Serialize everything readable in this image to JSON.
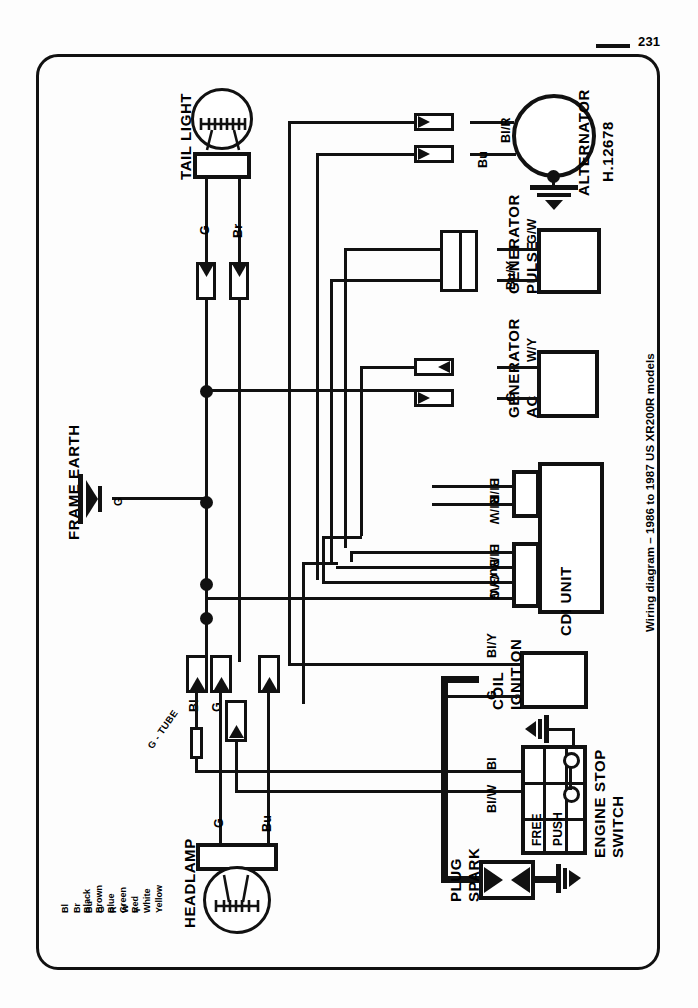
{
  "page": {
    "number": "231",
    "caption": "Wiring diagram – 1986 to 1987 US XR200R models"
  },
  "components": {
    "tail_light": {
      "label": "TAIL LIGHT",
      "wires": [
        "G",
        "Br"
      ]
    },
    "headlamp": {
      "label": "HEADLAMP",
      "wires": [
        "G",
        "Bu"
      ]
    },
    "frame_earth": {
      "label": "FRAME EARTH",
      "wire": "G"
    },
    "alternator": {
      "label": "ALTERNATOR",
      "code": "H.12678",
      "wires": [
        "Bl/R",
        "Bu"
      ]
    },
    "pulse_generator": {
      "label_line1": "PULSE",
      "label_line2": "GENERATOR",
      "wires": [
        "G/W",
        "Bu/Y"
      ]
    },
    "ac_generator": {
      "label_line1": "AC",
      "label_line2": "GENERATOR",
      "wires": [
        "W/Y",
        "G"
      ]
    },
    "cdi_unit": {
      "label": "CDI UNIT",
      "wires_upper": [
        "Bl/R",
        "Bl/W"
      ],
      "wires_lower": [
        "Bl/Y",
        "Bu/Y",
        "G/W",
        "G"
      ]
    },
    "ignition_coil": {
      "label_line1": "IGNITION",
      "label_line2": "COIL",
      "wires": [
        "Bl/Y",
        "G"
      ]
    },
    "engine_stop_switch": {
      "label_line1": "ENGINE STOP",
      "label_line2": "SWITCH",
      "positions": [
        "FREE",
        "PUSH"
      ],
      "wires": [
        "Bl/W",
        "Bl"
      ]
    },
    "spark_plug": {
      "label_line1": "SPARK",
      "label_line2": "PLUG"
    },
    "mid_connectors": {
      "g_tube": "G - TUBE",
      "wires": [
        "Bl",
        "G"
      ]
    }
  },
  "legend": {
    "codes": [
      "Bl",
      "Br",
      "Bu",
      "G",
      "R",
      "W",
      "Y"
    ],
    "names": [
      "Black",
      "Brown",
      "Blue",
      "Green",
      "Red",
      "White",
      "Yellow"
    ]
  },
  "colors": {
    "ink": "#111111",
    "paper": "#fdfdfd"
  }
}
